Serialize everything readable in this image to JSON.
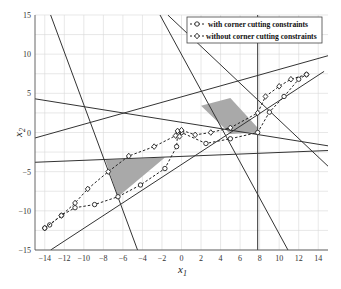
{
  "chart_data": {
    "type": "line",
    "title": "",
    "xlabel": "x1",
    "ylabel": "x2",
    "xlim": [
      -15,
      15
    ],
    "ylim": [
      -15,
      15
    ],
    "grid": true,
    "legend_position": "upper right",
    "x_ticks": [
      -14,
      -12,
      -10,
      -8,
      -6,
      -4,
      -2,
      0,
      2,
      4,
      6,
      8,
      10,
      12,
      14
    ],
    "y_ticks": [
      -15,
      -10,
      -5,
      0,
      5,
      10,
      15
    ],
    "constraint_lines": [
      {
        "name": "line-1",
        "points": [
          [
            -13.4,
            15
          ],
          [
            -4.5,
            -15
          ]
        ]
      },
      {
        "name": "line-2",
        "points": [
          [
            -15,
            4.3
          ],
          [
            15,
            -1.7
          ]
        ]
      },
      {
        "name": "line-3",
        "points": [
          [
            -15,
            -0.7
          ],
          [
            15,
            9.8
          ]
        ]
      },
      {
        "name": "line-4",
        "points": [
          [
            -15,
            -3.8
          ],
          [
            15,
            -2.3
          ]
        ]
      },
      {
        "name": "line-5",
        "points": [
          [
            -13.4,
            -15
          ],
          [
            14.6,
            7.8
          ]
        ]
      },
      {
        "name": "line-6",
        "points": [
          [
            -2.2,
            15
          ],
          [
            10.9,
            -15
          ]
        ]
      },
      {
        "name": "line-7",
        "points": [
          [
            -1.4,
            15
          ],
          [
            15,
            -4.3
          ]
        ]
      },
      {
        "name": "line-8",
        "points": [
          [
            7.8,
            15
          ],
          [
            7.8,
            -15
          ]
        ]
      }
    ],
    "shaded_regions": [
      {
        "name": "region-left",
        "points": [
          [
            -7.8,
            -3.5
          ],
          [
            -1.7,
            -3.2
          ],
          [
            -6.5,
            -8.2
          ]
        ],
        "color": "#a9a9a9"
      },
      {
        "name": "region-right",
        "points": [
          [
            2.0,
            3.4
          ],
          [
            5.0,
            4.4
          ],
          [
            7.8,
            0.6
          ],
          [
            7.8,
            0.0
          ],
          [
            5.0,
            -0.2
          ]
        ],
        "color": "#a9a9a9"
      }
    ],
    "series": [
      {
        "name": "with corner cutting constraints",
        "marker": "circle",
        "points": [
          [
            -14,
            -12.2
          ],
          [
            -13.5,
            -11.8
          ],
          [
            -12.3,
            -10.6
          ],
          [
            -10.9,
            -9.6
          ],
          [
            -8.9,
            -9.2
          ],
          [
            -6.5,
            -8.2
          ],
          [
            -4.2,
            -6.7
          ],
          [
            -1.7,
            -4.6
          ],
          [
            -0.5,
            -1.8
          ],
          [
            -0.4,
            -0.2
          ],
          [
            0.0,
            0.0
          ],
          [
            2.5,
            -1.4
          ],
          [
            5.0,
            -0.8
          ],
          [
            7.8,
            0.0
          ],
          [
            9.0,
            2.6
          ],
          [
            10.5,
            4.6
          ],
          [
            12.0,
            6.8
          ],
          [
            12.8,
            7.4
          ]
        ]
      },
      {
        "name": "without corner cutting constraints",
        "marker": "diamond",
        "points": [
          [
            -14,
            -12.2
          ],
          [
            -12.3,
            -10.6
          ],
          [
            -10.9,
            -9.0
          ],
          [
            -9.6,
            -7.2
          ],
          [
            -7.5,
            -5.0
          ],
          [
            -5.4,
            -3.0
          ],
          [
            -2.8,
            -1.8
          ],
          [
            -0.6,
            -0.4
          ],
          [
            -0.4,
            0.2
          ],
          [
            -0.2,
            -0.5
          ],
          [
            0.0,
            0.3
          ],
          [
            1.4,
            -0.3
          ],
          [
            3.0,
            0.0
          ],
          [
            5.0,
            0.6
          ],
          [
            7.8,
            2.5
          ],
          [
            8.6,
            4.6
          ],
          [
            10.0,
            5.9
          ],
          [
            11.2,
            6.8
          ],
          [
            12.8,
            7.4
          ]
        ]
      }
    ]
  },
  "legend": {
    "items": [
      {
        "label": "with corner cutting constraints",
        "marker": "circle"
      },
      {
        "label": "without corner cutting constraints",
        "marker": "diamond"
      }
    ]
  },
  "axes": {
    "xlabel_main": "x",
    "xlabel_sub": "1",
    "ylabel_main": "x",
    "ylabel_sub": "2"
  },
  "colors": {
    "line": "#333333",
    "grid": "#d9d9d9",
    "shade": "#a9a9a9",
    "axis": "#555555"
  }
}
